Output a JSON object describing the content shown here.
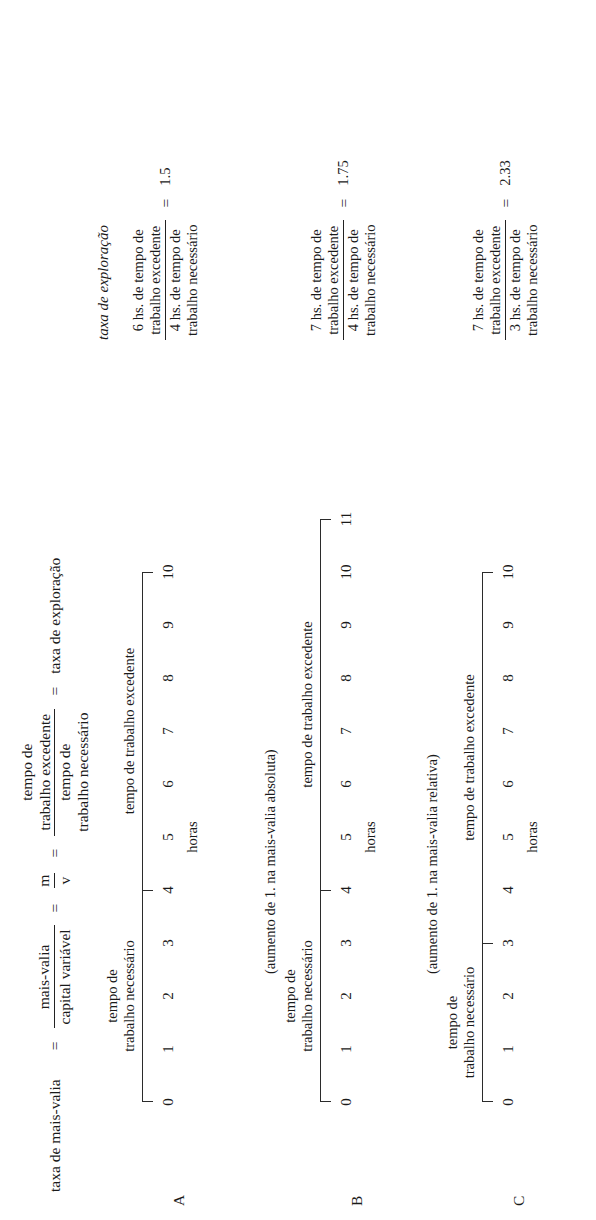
{
  "figure": {
    "title_formula": {
      "label": "taxa de mais-valia",
      "eq1": "=",
      "f1_num": "mais-valia",
      "f1_den": "capital variável",
      "eq2": "=",
      "f2_num": "m",
      "f2_den": "v",
      "eq3": "=",
      "f3_num_l1": "tempo de",
      "f3_num_l2": "trabalho excedente",
      "f3_den_l1": "tempo de",
      "f3_den_l2": "trabalho necessário",
      "eq4": "=",
      "result": "taxa de exploração"
    },
    "column_header": "taxa de exploração",
    "labels": {
      "necessario_l1": "tempo de",
      "necessario_l2": "trabalho necessário",
      "excedente": "tempo de trabalho excedente",
      "hours_axis": "horas"
    },
    "rows": [
      {
        "id": "A",
        "ticks": [
          "0",
          "1",
          "2",
          "3",
          "4",
          "5",
          "6",
          "7",
          "8",
          "9",
          "10"
        ],
        "necessary_end": 4,
        "surplus_end": 10,
        "formula": {
          "num_l1": "6 hs. de tempo de",
          "num_l2": "trabalho excedente",
          "den_l1": "4 hs. de tempo de",
          "den_l2": "trabalho necessário",
          "eq": "=",
          "value": "1.5"
        }
      },
      {
        "id": "B",
        "ticks": [
          "0",
          "1",
          "2",
          "3",
          "4",
          "5",
          "6",
          "7",
          "8",
          "9",
          "10",
          "11"
        ],
        "necessary_end": 4,
        "surplus_end": 11,
        "formula": {
          "num_l1": "7 hs. de tempo de",
          "num_l2": "trabalho excedente",
          "den_l1": "4 hs. de tempo de",
          "den_l2": "trabalho necessário",
          "eq": "=",
          "value": "1.75"
        }
      },
      {
        "id": "C",
        "ticks": [
          "0",
          "1",
          "2",
          "3",
          "4",
          "5",
          "6",
          "7",
          "8",
          "9",
          "10"
        ],
        "necessary_end": 3,
        "surplus_end": 10,
        "formula": {
          "num_l1": "7 hs. de tempo de",
          "num_l2": "trabalho excedente",
          "den_l1": "3 hs. de tempo de",
          "den_l2": "trabalho necessário",
          "eq": "=",
          "value": "2.33"
        }
      }
    ],
    "captions": [
      "(aumento de 1. na mais-valia absoluta)",
      "(aumento de 1. na mais-valia relativa)"
    ]
  }
}
